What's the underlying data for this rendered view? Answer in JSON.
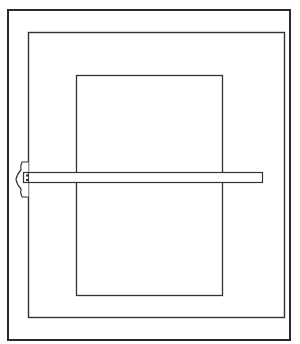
{
  "figure": {
    "colors": {
      "line": "#2a2a2a",
      "background": "#ffffff"
    },
    "elements": [
      {
        "name": "board-outer-frame",
        "x": 7,
        "y": 9,
        "w": 284,
        "h": 332
      },
      {
        "name": "drawing-board",
        "x": 28,
        "y": 32,
        "w": 257,
        "h": 286
      },
      {
        "name": "paper-sheet",
        "x": 76,
        "y": 75,
        "w": 147,
        "h": 221
      },
      {
        "name": "t-square-blade",
        "x": 23,
        "y": 172,
        "w": 240,
        "h": 11
      },
      {
        "name": "t-square-head",
        "x": 16,
        "y": 162,
        "w": 12,
        "h": 35
      }
    ]
  }
}
